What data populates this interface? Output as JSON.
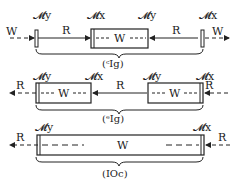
{
  "diagrams": [
    {
      "id": "row1",
      "left_arrow": "W",
      "right_arrow": "W",
      "labels_top": [
        "𝓜y",
        "𝓜x",
        "𝓜y",
        "𝓜x"
      ],
      "segments": [
        "R",
        "W",
        "R"
      ],
      "brace_label": "(ᶜIg)"
    },
    {
      "id": "row2",
      "left_arrow": "R",
      "right_arrow": "R",
      "labels_top": [
        "𝓜y",
        "𝓜x",
        "𝓜y",
        "𝓜x"
      ],
      "segments": [
        "W",
        "R",
        "W"
      ],
      "brace_label": "(ᵉIg)"
    },
    {
      "id": "row3",
      "left_arrow": "R",
      "right_arrow": "R",
      "labels_top": [
        "𝓜y",
        "𝓜x"
      ],
      "segments": [
        "W"
      ],
      "brace_label": "(IOc)"
    }
  ]
}
